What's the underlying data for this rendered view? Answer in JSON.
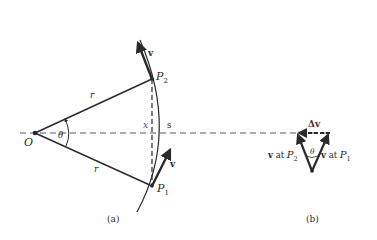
{
  "figure": {
    "panel_a": {
      "caption": "(a)",
      "labels": {
        "origin": "O",
        "point1": "P",
        "point1_sub": "1",
        "point2": "P",
        "point2_sub": "2",
        "radius_top": "r",
        "radius_bottom": "r",
        "angle": "θ",
        "chord": "x",
        "arc": "s",
        "velocity_top": "v",
        "velocity_bottom": "v"
      }
    },
    "panel_b": {
      "caption": "(b)",
      "labels": {
        "delta_v": "Δv",
        "angle": "θ",
        "v_at_p2_prefix": "v",
        "v_at_p2_at": " at ",
        "v_at_p2_point": "P",
        "v_at_p2_sub": "2",
        "v_at_p1_prefix": "v",
        "v_at_p1_at": " at ",
        "v_at_p1_point": "P",
        "v_at_p1_sub": "1"
      }
    },
    "colors": {
      "ink": "#2a2a2a",
      "chord_label": "#3a3a8a",
      "axis_dash": "#555577"
    }
  }
}
